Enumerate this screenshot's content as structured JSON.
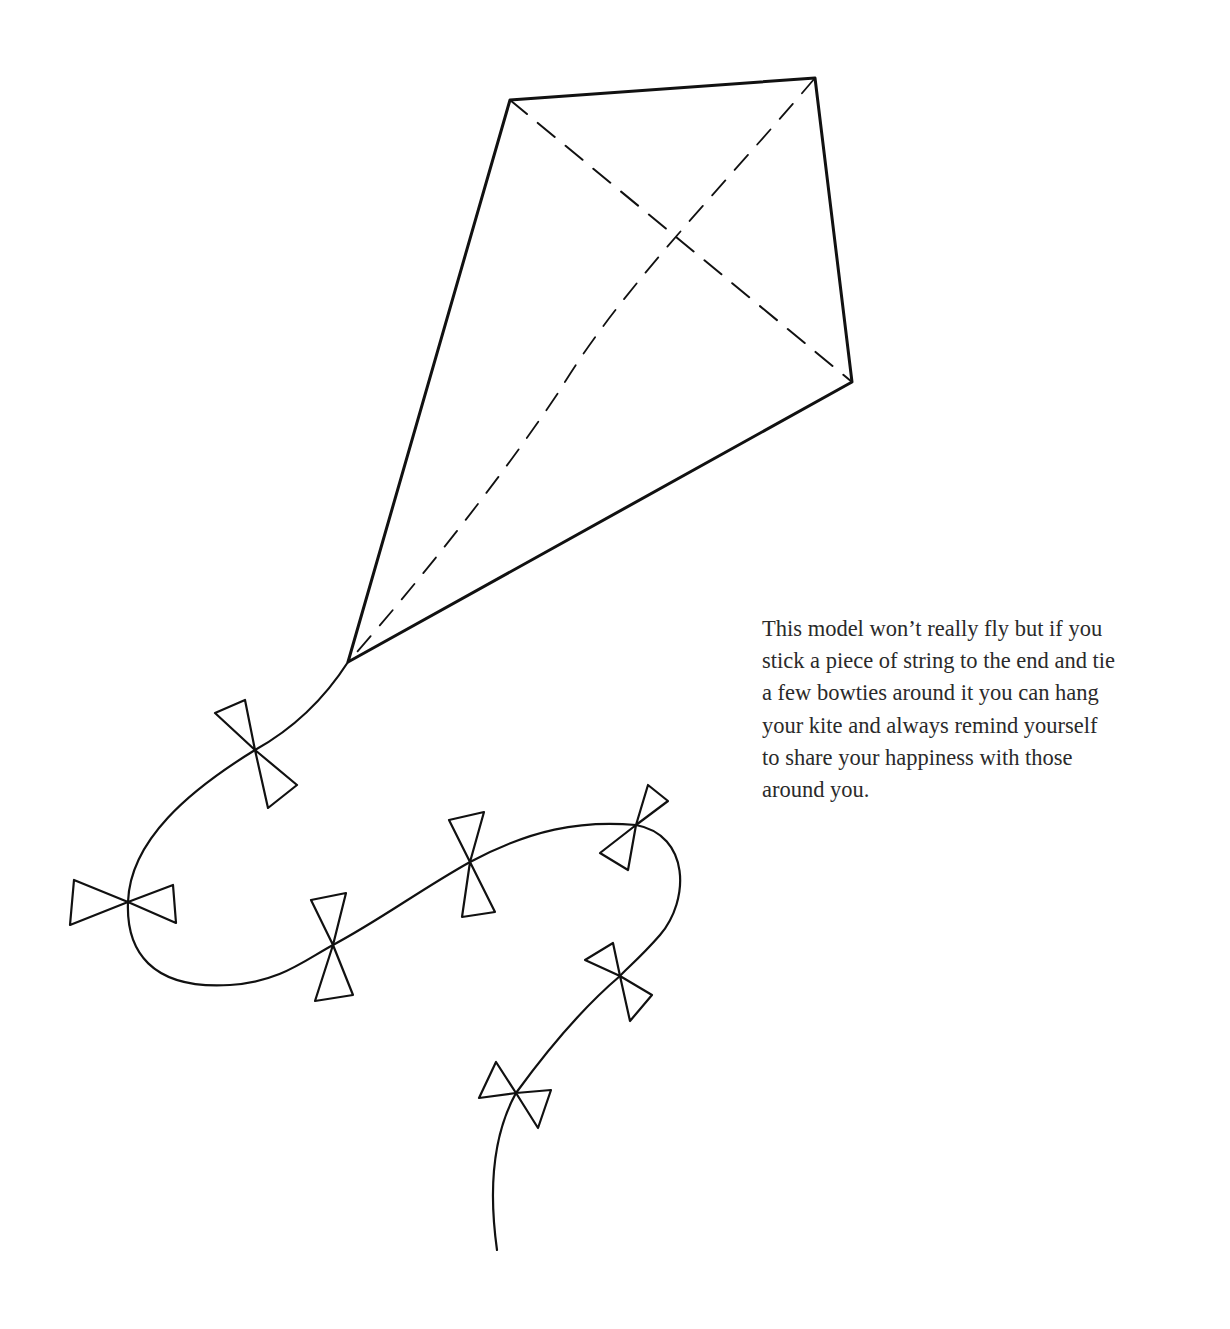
{
  "caption": {
    "lines": [
      "This model won’t really fly but if you",
      "stick a piece of string to the end and tie",
      "a few bowties around it you can hang",
      "your kite and always remind yourself",
      "to share your happiness with those",
      "around you."
    ]
  },
  "illustration": {
    "subject": "kite",
    "line_color": "#111111",
    "kite_vertices": {
      "top_left": [
        510,
        100
      ],
      "top_right": [
        815,
        78
      ],
      "right": [
        852,
        382
      ],
      "tip": [
        348,
        662
      ]
    },
    "bowtie_count": 7
  }
}
